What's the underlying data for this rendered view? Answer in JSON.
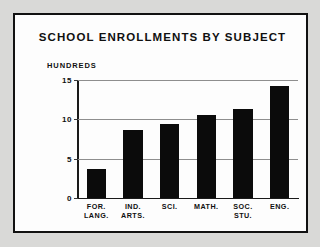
{
  "chart_data": {
    "type": "bar",
    "title": "SCHOOL ENROLLMENTS BY SUBJECT",
    "xlabel": "",
    "ylabel": "HUNDREDS",
    "categories": [
      "FOR.\nLANG.",
      "IND.\nARTS.",
      "SCI.",
      "MATH.",
      "SOC.\nSTU.",
      "ENG."
    ],
    "values": [
      3.7,
      8.7,
      9.4,
      10.5,
      11.3,
      14.2
    ],
    "ylim": [
      0,
      15
    ],
    "yticks": [
      0,
      5,
      10,
      15
    ],
    "ytick_labels": [
      "0",
      "5",
      "10",
      "15"
    ],
    "grid": true,
    "legend": false,
    "bar_color": "#0b0b0b",
    "grid_color": "#8e8e8e",
    "frame_color": "#111111",
    "background_color": "#fdfdfd"
  }
}
